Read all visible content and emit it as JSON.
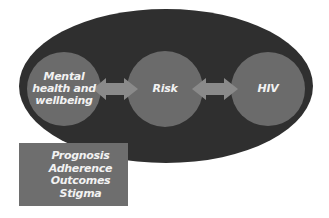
{
  "diagram": {
    "colors": {
      "ellipse": "#2f2f2f",
      "node": "#6b6b6b",
      "arrow": "#8a8a8a",
      "box": "#6e6e6e",
      "text": "#f2f2f2"
    },
    "nodes": [
      {
        "id": "mental-health",
        "lines": [
          "Mental",
          "health and",
          "wellbeing"
        ]
      },
      {
        "id": "risk",
        "label": "Risk"
      },
      {
        "id": "hiv",
        "label": "HIV"
      }
    ],
    "arrows": [
      {
        "from": "mental-health",
        "to": "risk",
        "type": "bidirectional"
      },
      {
        "from": "risk",
        "to": "hiv",
        "type": "bidirectional"
      }
    ],
    "box": {
      "items": [
        "Prognosis",
        "Adherence",
        "Outcomes",
        "Stigma"
      ]
    }
  }
}
